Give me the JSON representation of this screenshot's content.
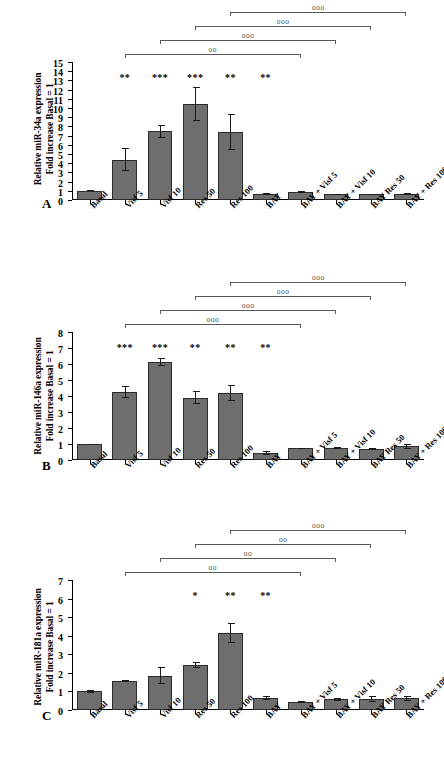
{
  "figure": {
    "categories": [
      "Basal",
      "Visf 5",
      "Visf 10",
      "Res 50",
      "Res 100",
      "BAY",
      "BAY + Visf 5",
      "BAY + Visf 10",
      "BAY Res 50",
      "BAY + Res 100"
    ],
    "bar_color": "#6e6e6e",
    "bar_edge_color": "#2b2b2b"
  },
  "panels": [
    {
      "letter": "A",
      "ytitle_line1": "Relative miR-34a expression",
      "ytitle_line2": "Fold increase Basal = 1",
      "ticks": [
        "0",
        "1",
        "2",
        "3",
        "4",
        "5",
        "6",
        "7",
        "8",
        "9",
        "10",
        "11",
        "12",
        "13",
        "14",
        "15"
      ],
      "stars": [
        "",
        "**",
        "***",
        "***",
        "**",
        "**",
        "",
        "",
        "",
        ""
      ],
      "brackets": [
        "oo",
        "ooo",
        "ooo",
        "ooo"
      ]
    },
    {
      "letter": "B",
      "ytitle_line1": "Relative miR-146a expression",
      "ytitle_line2": "Fold increase Basal = 1",
      "ticks": [
        "0",
        "1",
        "2",
        "3",
        "4",
        "5",
        "6",
        "7",
        "8"
      ],
      "stars": [
        "",
        "***",
        "***",
        "**",
        "**",
        "**",
        "",
        "",
        "",
        ""
      ],
      "brackets": [
        "ooo",
        "ooo",
        "ooo",
        "ooo"
      ]
    },
    {
      "letter": "C",
      "ytitle_line1": "Relative miR-181a expression",
      "ytitle_line2": "Fold increase Basal = 1",
      "ticks": [
        "0",
        "1",
        "2",
        "3",
        "4",
        "5",
        "6",
        "7"
      ],
      "stars": [
        "",
        "",
        "",
        "*",
        "**",
        "**",
        "",
        "",
        "",
        ""
      ],
      "brackets": [
        "oo",
        "oo",
        "oo",
        "ooo"
      ]
    }
  ],
  "chart_data": [
    {
      "type": "bar",
      "panel": "A",
      "title": "Relative miR-34a expression Fold increase Basal = 1",
      "xlabel": "",
      "ylabel": "Relative miR-34a expression / Fold increase Basal = 1",
      "ylim": [
        0,
        15
      ],
      "ytick_step": 1,
      "grid": false,
      "legend": "none",
      "categories": [
        "Basal",
        "Visf 5",
        "Visf 10",
        "Res 50",
        "Res 100",
        "BAY",
        "BAY + Visf 5",
        "BAY + Visf 10",
        "BAY Res 50",
        "BAY + Res 100"
      ],
      "values": [
        1.0,
        4.4,
        7.45,
        10.4,
        7.4,
        0.65,
        0.85,
        0.6,
        0.6,
        0.65
      ],
      "err_low": [
        0.0,
        1.3,
        0.75,
        1.85,
        2.0,
        0.1,
        0.12,
        0.08,
        0.08,
        0.08
      ],
      "err_high": [
        0.05,
        1.3,
        0.75,
        1.85,
        2.0,
        0.1,
        0.12,
        0.08,
        0.08,
        0.08
      ],
      "annotations": {
        "stars": [
          {
            "category": "Visf 5",
            "label": "**"
          },
          {
            "category": "Visf 10",
            "label": "***"
          },
          {
            "category": "Res 50",
            "label": "***"
          },
          {
            "category": "Res 100",
            "label": "**"
          },
          {
            "category": "BAY",
            "label": "**"
          }
        ],
        "comparison_brackets": [
          {
            "from": "Visf 5",
            "to": "BAY + Visf 5",
            "label": "oo"
          },
          {
            "from": "Visf 10",
            "to": "BAY + Visf 10",
            "label": "ooo"
          },
          {
            "from": "Res 50",
            "to": "BAY Res 50",
            "label": "ooo"
          },
          {
            "from": "Res 100",
            "to": "BAY + Res 100",
            "label": "ooo"
          }
        ]
      }
    },
    {
      "type": "bar",
      "panel": "B",
      "title": "Relative miR-146a expression Fold increase Basal = 1",
      "xlabel": "",
      "ylabel": "Relative miR-146a expression / Fold increase Basal = 1",
      "ylim": [
        0,
        8
      ],
      "ytick_step": 1,
      "grid": false,
      "legend": "none",
      "categories": [
        "Basal",
        "Visf 5",
        "Visf 10",
        "Res 50",
        "Res 100",
        "BAY",
        "BAY + Visf 5",
        "BAY + Visf 10",
        "BAY Res 50",
        "BAY + Res 100"
      ],
      "values": [
        1.0,
        4.25,
        6.1,
        3.9,
        4.2,
        0.42,
        0.72,
        0.75,
        0.7,
        0.85
      ],
      "err_low": [
        0.02,
        0.4,
        0.25,
        0.4,
        0.5,
        0.12,
        0.06,
        0.05,
        0.06,
        0.17
      ],
      "err_high": [
        0.02,
        0.4,
        0.25,
        0.4,
        0.5,
        0.12,
        0.06,
        0.05,
        0.06,
        0.17
      ],
      "annotations": {
        "stars": [
          {
            "category": "Visf 5",
            "label": "***"
          },
          {
            "category": "Visf 10",
            "label": "***"
          },
          {
            "category": "Res 50",
            "label": "**"
          },
          {
            "category": "Res 100",
            "label": "**"
          },
          {
            "category": "BAY",
            "label": "**"
          }
        ],
        "comparison_brackets": [
          {
            "from": "Visf 5",
            "to": "BAY + Visf 5",
            "label": "ooo"
          },
          {
            "from": "Visf 10",
            "to": "BAY + Visf 10",
            "label": "ooo"
          },
          {
            "from": "Res 50",
            "to": "BAY Res 50",
            "label": "ooo"
          },
          {
            "from": "Res 100",
            "to": "BAY + Res 100",
            "label": "ooo"
          }
        ]
      }
    },
    {
      "type": "bar",
      "panel": "C",
      "title": "Relative miR-181a expression Fold increase Basal = 1",
      "xlabel": "",
      "ylabel": "Relative miR-181a expression / Fold increase Basal = 1",
      "ylim": [
        0,
        7
      ],
      "ytick_step": 1,
      "grid": false,
      "legend": "none",
      "categories": [
        "Basal",
        "Visf 5",
        "Visf 10",
        "Res 50",
        "Res 100",
        "BAY",
        "BAY + Visf 5",
        "BAY + Visf 10",
        "BAY Res 50",
        "BAY + Res 100"
      ],
      "values": [
        1.02,
        1.55,
        1.85,
        2.42,
        4.15,
        0.63,
        0.45,
        0.57,
        0.58,
        0.63
      ],
      "err_low": [
        0.08,
        0.05,
        0.45,
        0.17,
        0.52,
        0.1,
        0.05,
        0.06,
        0.15,
        0.13
      ],
      "err_high": [
        0.08,
        0.05,
        0.45,
        0.17,
        0.52,
        0.1,
        0.05,
        0.06,
        0.15,
        0.13
      ],
      "annotations": {
        "stars": [
          {
            "category": "Res 50",
            "label": "*"
          },
          {
            "category": "Res 100",
            "label": "**"
          },
          {
            "category": "BAY",
            "label": "**"
          }
        ],
        "comparison_brackets": [
          {
            "from": "Visf 5",
            "to": "BAY + Visf 5",
            "label": "oo"
          },
          {
            "from": "Visf 10",
            "to": "BAY + Visf 10",
            "label": "oo"
          },
          {
            "from": "Res 50",
            "to": "BAY Res 50",
            "label": "oo"
          },
          {
            "from": "Res 100",
            "to": "BAY + Res 100",
            "label": "ooo"
          }
        ]
      }
    }
  ]
}
